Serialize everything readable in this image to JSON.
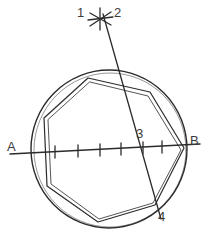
{
  "figure": {
    "kind": "geometric-construction-diagram",
    "background_color": "#ffffff",
    "ink_color": "#2b2b2b",
    "label_color": "#3a3a3a",
    "canvas": {
      "width": 207,
      "height": 233
    }
  },
  "labels": {
    "point_1": "1",
    "point_2": "2",
    "point_3": "3",
    "point_4": "4",
    "point_a": "A",
    "point_b": "B"
  },
  "label_positions": {
    "point_1": {
      "x": 77,
      "y": 6
    },
    "point_2": {
      "x": 114,
      "y": 6
    },
    "point_3": {
      "x": 136,
      "y": 127
    },
    "point_4": {
      "x": 158,
      "y": 210
    },
    "point_a": {
      "x": 7,
      "y": 140
    },
    "point_b": {
      "x": 190,
      "y": 134
    }
  },
  "geometry": {
    "circle": {
      "cx": 109,
      "cy": 149,
      "r": 78
    },
    "inner_circle": {
      "cx": 109,
      "cy": 150,
      "r": 75
    },
    "diameter_line": {
      "name": "line-AB",
      "x1": 10,
      "y1": 154,
      "x2": 200,
      "y2": 144
    },
    "tick_marks": {
      "count": 6,
      "positions_x": [
        55,
        78,
        100,
        121,
        143,
        162
      ],
      "half_length": 6
    },
    "construction_line": {
      "name": "line-2-to-4",
      "x1": 103,
      "y1": 14,
      "x2": 161,
      "y2": 219
    },
    "star_mark": {
      "cx": 100,
      "cy": 18,
      "spokes": 6,
      "radius": 11
    },
    "polygon_outer": [
      {
        "x": 88,
        "y": 78
      },
      {
        "x": 150,
        "y": 92
      },
      {
        "x": 184,
        "y": 148
      },
      {
        "x": 155,
        "y": 205
      },
      {
        "x": 98,
        "y": 222
      },
      {
        "x": 47,
        "y": 186
      },
      {
        "x": 44,
        "y": 118
      }
    ],
    "polygon_inner": [
      {
        "x": 90,
        "y": 82
      },
      {
        "x": 148,
        "y": 96
      },
      {
        "x": 181,
        "y": 150
      },
      {
        "x": 153,
        "y": 203
      },
      {
        "x": 99,
        "y": 219
      },
      {
        "x": 51,
        "y": 184
      },
      {
        "x": 48,
        "y": 120
      }
    ]
  }
}
